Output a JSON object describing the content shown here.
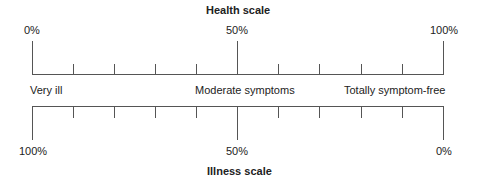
{
  "health_scale": {
    "title": "Health scale",
    "labels": {
      "left": "0%",
      "middle": "50%",
      "right": "100%"
    }
  },
  "illness_scale": {
    "title": "Illness scale",
    "labels": {
      "left": "100%",
      "middle": "50%",
      "right": "0%"
    }
  },
  "descriptors": {
    "left": "Very ill",
    "middle": "Moderate symptoms",
    "right": "Totally symptom-free"
  },
  "scale": {
    "divisions": 10,
    "line_color": "#555555"
  }
}
